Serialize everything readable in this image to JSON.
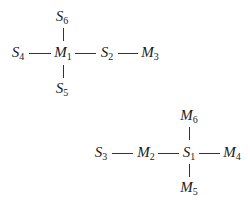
{
  "diagram": {
    "graph1": {
      "nodes": [
        {
          "id": "S6",
          "letter": "S",
          "sub": "6"
        },
        {
          "id": "S4",
          "letter": "S",
          "sub": "4"
        },
        {
          "id": "M1",
          "letter": "M",
          "sub": "1"
        },
        {
          "id": "S2",
          "letter": "S",
          "sub": "2"
        },
        {
          "id": "M3",
          "letter": "M",
          "sub": "3"
        },
        {
          "id": "S5",
          "letter": "S",
          "sub": "5"
        }
      ],
      "edges": [
        [
          "S4",
          "M1"
        ],
        [
          "M1",
          "S2"
        ],
        [
          "S2",
          "M3"
        ],
        [
          "S6",
          "M1"
        ],
        [
          "M1",
          "S5"
        ]
      ]
    },
    "graph2": {
      "nodes": [
        {
          "id": "M6",
          "letter": "M",
          "sub": "6"
        },
        {
          "id": "S3",
          "letter": "S",
          "sub": "3"
        },
        {
          "id": "M2",
          "letter": "M",
          "sub": "2"
        },
        {
          "id": "S1",
          "letter": "S",
          "sub": "1"
        },
        {
          "id": "M4",
          "letter": "M",
          "sub": "4"
        },
        {
          "id": "M5",
          "letter": "M",
          "sub": "5"
        }
      ],
      "edges": [
        [
          "S3",
          "M2"
        ],
        [
          "M2",
          "S1"
        ],
        [
          "S1",
          "M4"
        ],
        [
          "M6",
          "S1"
        ],
        [
          "S1",
          "M5"
        ]
      ]
    }
  }
}
